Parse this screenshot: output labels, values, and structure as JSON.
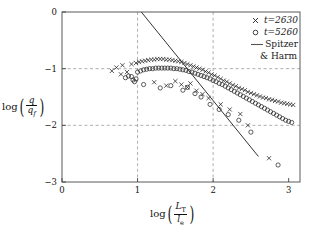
{
  "chart_data": {
    "type": "scatter",
    "title": "",
    "xlabel": "log (L_T / l_e)",
    "ylabel": "log (q / q_f)",
    "xlim": [
      0,
      3.15
    ],
    "ylim": [
      -3,
      0
    ],
    "xticks": [
      "0",
      "1",
      "2",
      "3"
    ],
    "xtick_values": [
      0,
      1,
      2,
      3
    ],
    "yticks": [
      "0",
      "-1",
      "-2",
      "-3"
    ],
    "ytick_values": [
      0,
      -1,
      -2,
      -3
    ],
    "grid": "dashed gridlines at x=1, x=2 and y=-1, y=-2",
    "legend_position": "top-right",
    "series": [
      {
        "name": "t=2630",
        "marker": "x",
        "label": "t=2630",
        "points": [
          [
            0.66,
            -1.04
          ],
          [
            0.72,
            -0.98
          ],
          [
            0.78,
            -1.1
          ],
          [
            0.8,
            -0.94
          ],
          [
            0.86,
            -1.06
          ],
          [
            0.92,
            -0.92
          ],
          [
            0.98,
            -0.9
          ],
          [
            1.02,
            -0.88
          ],
          [
            1.06,
            -0.87
          ],
          [
            1.1,
            -0.86
          ],
          [
            1.14,
            -0.85
          ],
          [
            1.18,
            -0.84
          ],
          [
            1.22,
            -0.84
          ],
          [
            1.26,
            -0.83
          ],
          [
            1.3,
            -0.83
          ],
          [
            1.34,
            -0.83
          ],
          [
            1.38,
            -0.84
          ],
          [
            1.42,
            -0.84
          ],
          [
            1.46,
            -0.85
          ],
          [
            1.5,
            -0.86
          ],
          [
            1.54,
            -0.87
          ],
          [
            1.58,
            -0.88
          ],
          [
            1.62,
            -0.9
          ],
          [
            1.66,
            -0.92
          ],
          [
            1.7,
            -0.94
          ],
          [
            1.74,
            -0.96
          ],
          [
            1.78,
            -0.98
          ],
          [
            1.82,
            -1.0
          ],
          [
            1.86,
            -1.02
          ],
          [
            1.9,
            -1.05
          ],
          [
            1.94,
            -1.07
          ],
          [
            1.98,
            -1.1
          ],
          [
            2.02,
            -1.12
          ],
          [
            2.06,
            -1.15
          ],
          [
            2.1,
            -1.18
          ],
          [
            2.14,
            -1.21
          ],
          [
            2.18,
            -1.23
          ],
          [
            2.22,
            -1.26
          ],
          [
            2.26,
            -1.29
          ],
          [
            2.3,
            -1.31
          ],
          [
            2.34,
            -1.34
          ],
          [
            2.38,
            -1.36
          ],
          [
            2.42,
            -1.38
          ],
          [
            2.46,
            -1.41
          ],
          [
            2.5,
            -1.43
          ],
          [
            2.54,
            -1.45
          ],
          [
            2.58,
            -1.47
          ],
          [
            2.62,
            -1.49
          ],
          [
            2.66,
            -1.51
          ],
          [
            2.7,
            -1.52
          ],
          [
            2.74,
            -1.54
          ],
          [
            2.78,
            -1.55
          ],
          [
            2.82,
            -1.57
          ],
          [
            2.86,
            -1.58
          ],
          [
            2.9,
            -1.6
          ],
          [
            2.94,
            -1.61
          ],
          [
            2.98,
            -1.62
          ],
          [
            3.02,
            -1.63
          ],
          [
            3.06,
            -1.64
          ],
          [
            1.22,
            -1.24
          ],
          [
            1.38,
            -1.3
          ],
          [
            1.5,
            -1.22
          ],
          [
            1.58,
            -1.28
          ],
          [
            1.66,
            -1.33
          ],
          [
            1.7,
            -1.26
          ],
          [
            1.78,
            -1.39
          ],
          [
            1.86,
            -1.45
          ],
          [
            1.94,
            -1.52
          ],
          [
            2.1,
            -1.63
          ],
          [
            2.22,
            -1.72
          ],
          [
            2.36,
            -1.8
          ],
          [
            2.46,
            -2.0
          ],
          [
            2.74,
            -2.58
          ]
        ]
      },
      {
        "name": "t=5260",
        "marker": "o",
        "label": "t=5260",
        "points": [
          [
            0.84,
            -1.16
          ],
          [
            0.88,
            -1.13
          ],
          [
            0.92,
            -1.14
          ],
          [
            0.94,
            -1.2
          ],
          [
            0.96,
            -1.23
          ],
          [
            0.98,
            -1.18
          ],
          [
            1.0,
            -1.06
          ],
          [
            1.04,
            -1.04
          ],
          [
            1.08,
            -1.02
          ],
          [
            1.12,
            -1.01
          ],
          [
            1.16,
            -1.0
          ],
          [
            1.2,
            -1.0
          ],
          [
            1.24,
            -0.99
          ],
          [
            1.28,
            -0.99
          ],
          [
            1.32,
            -0.99
          ],
          [
            1.36,
            -0.99
          ],
          [
            1.4,
            -0.99
          ],
          [
            1.44,
            -0.99
          ],
          [
            1.48,
            -1.0
          ],
          [
            1.52,
            -1.0
          ],
          [
            1.56,
            -1.01
          ],
          [
            1.6,
            -1.02
          ],
          [
            1.64,
            -1.03
          ],
          [
            1.68,
            -1.05
          ],
          [
            1.72,
            -1.06
          ],
          [
            1.76,
            -1.08
          ],
          [
            1.8,
            -1.1
          ],
          [
            1.84,
            -1.12
          ],
          [
            1.88,
            -1.14
          ],
          [
            1.92,
            -1.16
          ],
          [
            1.96,
            -1.18
          ],
          [
            2.0,
            -1.21
          ],
          [
            2.04,
            -1.23
          ],
          [
            2.08,
            -1.26
          ],
          [
            2.12,
            -1.28
          ],
          [
            2.16,
            -1.31
          ],
          [
            2.2,
            -1.34
          ],
          [
            2.24,
            -1.37
          ],
          [
            2.28,
            -1.4
          ],
          [
            2.32,
            -1.43
          ],
          [
            2.36,
            -1.46
          ],
          [
            2.4,
            -1.49
          ],
          [
            2.44,
            -1.52
          ],
          [
            2.48,
            -1.55
          ],
          [
            2.52,
            -1.58
          ],
          [
            2.56,
            -1.61
          ],
          [
            2.6,
            -1.64
          ],
          [
            2.64,
            -1.67
          ],
          [
            2.68,
            -1.7
          ],
          [
            2.72,
            -1.73
          ],
          [
            2.76,
            -1.76
          ],
          [
            2.8,
            -1.79
          ],
          [
            2.84,
            -1.82
          ],
          [
            2.88,
            -1.85
          ],
          [
            2.92,
            -1.88
          ],
          [
            2.96,
            -1.91
          ],
          [
            3.0,
            -1.93
          ],
          [
            3.04,
            -1.95
          ],
          [
            1.08,
            -1.28
          ],
          [
            1.3,
            -1.34
          ],
          [
            1.44,
            -1.3
          ],
          [
            1.6,
            -1.38
          ],
          [
            1.66,
            -1.33
          ],
          [
            1.76,
            -1.44
          ],
          [
            1.84,
            -1.5
          ],
          [
            1.96,
            -1.63
          ],
          [
            2.08,
            -1.72
          ],
          [
            2.2,
            -1.81
          ],
          [
            2.34,
            -1.91
          ],
          [
            2.5,
            -2.12
          ],
          [
            2.86,
            -2.7
          ]
        ]
      }
    ],
    "lines": [
      {
        "name": "Spitzer & Harm",
        "label": "Spitzer & Harm",
        "style": "solid",
        "x0": 1.05,
        "y0": 0.0,
        "x1": 2.6,
        "y1": -2.55
      }
    ]
  },
  "legend": {
    "entries": [
      {
        "symbol": "x",
        "label": "t=2630",
        "italic": true
      },
      {
        "symbol": "o",
        "label": "t=5260",
        "italic": true
      },
      {
        "symbol": "line",
        "label": "Spitzer",
        "label2": "& Harm",
        "italic": false
      }
    ]
  },
  "axes": {
    "y_label_parts": {
      "fn": "log",
      "num": "q",
      "den": "q",
      "den_sub": "f"
    },
    "x_label_parts": {
      "fn": "log",
      "num": "L",
      "num_sub": "T",
      "den": "l",
      "den_sub": "e"
    }
  }
}
